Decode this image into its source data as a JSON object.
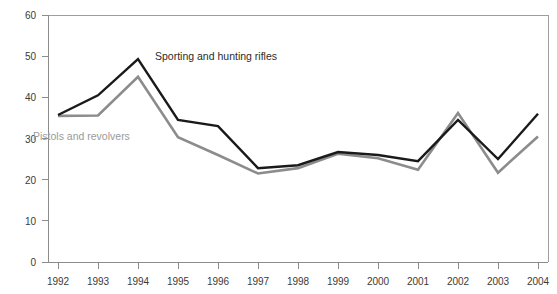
{
  "chart_data": {
    "type": "line",
    "title": "",
    "subtitle": "",
    "xlabel": "",
    "ylabel": "",
    "categories": [
      "1992",
      "1993",
      "1994",
      "1995",
      "1996",
      "1997",
      "1998",
      "1999",
      "2000",
      "2001",
      "2002",
      "2003",
      "2004"
    ],
    "xlim": [
      "1992",
      "2004"
    ],
    "ylim": [
      0,
      60
    ],
    "yticks": [
      0,
      10,
      20,
      30,
      40,
      50,
      60
    ],
    "ytick_labels": [
      "0",
      "10",
      "20",
      "30",
      "40",
      "50",
      "60"
    ],
    "grid": false,
    "legend": "inline-annotations",
    "series": [
      {
        "name": "Sporting and hunting rifles",
        "color": "#1a1a1a",
        "values": [
          35.7,
          40.5,
          49.3,
          34.5,
          33.0,
          22.8,
          23.5,
          26.7,
          26.0,
          24.5,
          34.5,
          25.0,
          36.0
        ]
      },
      {
        "name": "Pistols and revolvers",
        "color": "#8c8c8c",
        "values": [
          35.5,
          35.6,
          45.0,
          30.3,
          26.0,
          21.5,
          22.8,
          26.3,
          25.2,
          22.4,
          36.2,
          21.7,
          30.5
        ]
      }
    ],
    "annotations": [
      {
        "text": "Sporting and hunting rifles",
        "x": "1994",
        "y": 50.0,
        "color": "#2b2b2b"
      },
      {
        "text": "Pistols and revolvers",
        "x": "1992",
        "y": 30.0,
        "color": "#9a9a9a"
      }
    ]
  },
  "axis": {
    "y_label_0": "0",
    "y_label_10": "10",
    "y_label_20": "20",
    "y_label_30": "30",
    "y_label_40": "40",
    "y_label_50": "50",
    "y_label_60": "60",
    "x_label_1992": "1992",
    "x_label_1993": "1993",
    "x_label_1994": "1994",
    "x_label_1995": "1995",
    "x_label_1996": "1996",
    "x_label_1997": "1997",
    "x_label_1998": "1998",
    "x_label_1999": "1999",
    "x_label_2000": "2000",
    "x_label_2001": "2001",
    "x_label_2002": "2002",
    "x_label_2003": "2003",
    "x_label_2004": "2004"
  },
  "labels": {
    "rifles": "Sporting and hunting rifles",
    "pistols": "Pistols and revolvers"
  },
  "colors": {
    "rifles_line": "#1a1a1a",
    "pistols_line": "#8c8c8c",
    "axis": "#8c8c8c",
    "border": "#9e9e9e",
    "background": "#ffffff"
  }
}
